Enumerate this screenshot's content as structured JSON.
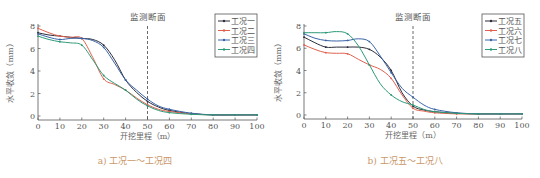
{
  "chart_data": [
    {
      "type": "line",
      "panel": "a",
      "caption": "a) 工况一～工况四",
      "annotation": "监测断面",
      "annotation_x": 50,
      "xlabel": "开挖里程（m）",
      "ylabel": "水平收敛（mm）",
      "xlim": [
        0,
        100
      ],
      "ylim": [
        0,
        8
      ],
      "xticks": [
        0,
        10,
        20,
        30,
        40,
        50,
        60,
        70,
        80,
        90,
        100
      ],
      "yticks": [
        0,
        2,
        4,
        6,
        8
      ],
      "grid": false,
      "legend_position": "upper right",
      "x": [
        0,
        5,
        10,
        15,
        20,
        25,
        30,
        35,
        40,
        45,
        50,
        55,
        60,
        70,
        80,
        90,
        100
      ],
      "series": [
        {
          "name": "工况一",
          "color": "#2b2b3a",
          "values": [
            7.4,
            7.2,
            7.1,
            7.0,
            6.9,
            6.8,
            6.3,
            5.0,
            3.2,
            2.1,
            1.3,
            0.8,
            0.5,
            0.2,
            0.1,
            0.1,
            0.1
          ]
        },
        {
          "name": "工况二",
          "color": "#e0614f",
          "values": [
            7.8,
            7.4,
            7.1,
            7.0,
            6.9,
            5.2,
            3.3,
            2.8,
            2.3,
            1.6,
            1.0,
            0.6,
            0.4,
            0.2,
            0.1,
            0.1,
            0.1
          ]
        },
        {
          "name": "工况三",
          "color": "#3a64a8",
          "values": [
            7.3,
            7.0,
            6.8,
            6.9,
            6.9,
            6.7,
            6.1,
            4.7,
            3.2,
            2.3,
            1.5,
            0.9,
            0.6,
            0.25,
            0.1,
            0.1,
            0.1
          ]
        },
        {
          "name": "工况四",
          "color": "#2e9a78",
          "values": [
            7.1,
            6.8,
            6.6,
            6.5,
            6.3,
            5.0,
            3.6,
            2.9,
            2.3,
            1.5,
            0.9,
            0.5,
            0.3,
            0.15,
            0.1,
            0.1,
            0.1
          ]
        }
      ]
    },
    {
      "type": "line",
      "panel": "b",
      "caption": "b) 工况五～工况八",
      "annotation": "监测断面",
      "annotation_x": 50,
      "xlabel": "开挖里程（m）",
      "ylabel": "水平收敛（mm）",
      "xlim": [
        0,
        100
      ],
      "ylim": [
        0,
        8
      ],
      "xticks": [
        0,
        10,
        20,
        30,
        40,
        50,
        60,
        70,
        80,
        90,
        100
      ],
      "yticks": [
        0,
        2,
        4,
        6,
        8
      ],
      "grid": false,
      "legend_position": "upper right",
      "x": [
        0,
        5,
        10,
        15,
        20,
        25,
        30,
        35,
        40,
        45,
        50,
        55,
        60,
        70,
        80,
        90,
        100
      ],
      "series": [
        {
          "name": "工况五",
          "color": "#2b2b3a",
          "values": [
            7.0,
            6.5,
            6.1,
            6.1,
            6.1,
            6.1,
            5.9,
            5.2,
            4.0,
            2.0,
            0.8,
            0.45,
            0.3,
            0.15,
            0.1,
            0.1,
            0.1
          ]
        },
        {
          "name": "工况六",
          "color": "#e0614f",
          "values": [
            6.3,
            5.9,
            5.6,
            5.55,
            5.5,
            5.0,
            4.5,
            4.1,
            3.3,
            1.8,
            0.6,
            0.35,
            0.2,
            0.1,
            0.1,
            0.1,
            0.1
          ]
        },
        {
          "name": "工况七",
          "color": "#3a64a8",
          "values": [
            7.3,
            6.9,
            6.7,
            6.65,
            6.7,
            6.85,
            6.6,
            5.3,
            3.8,
            2.4,
            1.6,
            0.9,
            0.5,
            0.2,
            0.1,
            0.1,
            0.1
          ]
        },
        {
          "name": "工况八",
          "color": "#2e9a78",
          "values": [
            7.4,
            7.4,
            7.4,
            7.5,
            7.3,
            6.2,
            4.5,
            2.8,
            1.8,
            1.2,
            0.9,
            0.5,
            0.3,
            0.15,
            0.1,
            0.1,
            0.1
          ]
        }
      ]
    }
  ]
}
